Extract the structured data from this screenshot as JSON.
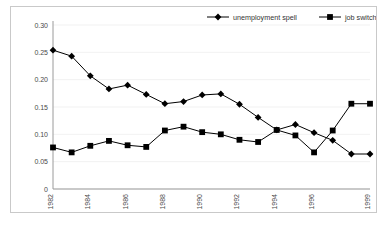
{
  "chart_data": {
    "type": "line",
    "title": "",
    "xlabel": "",
    "ylabel": "",
    "ylim": [
      0,
      0.3
    ],
    "grid": true,
    "legend_position": "top-right",
    "x": [
      1982,
      1983,
      1984,
      1985,
      1986,
      1987,
      1988,
      1989,
      1990,
      1991,
      1992,
      1993,
      1994,
      1995,
      1996,
      1997,
      1998,
      1999
    ],
    "x_tick_labels": [
      "1982",
      "",
      "1984",
      "",
      "1986",
      "",
      "1988",
      "",
      "1990",
      "",
      "1992",
      "",
      "1994",
      "",
      "1996",
      "",
      "",
      "1999"
    ],
    "y_tick_labels": [
      "0.30",
      "0.25",
      "0.20",
      "0.15",
      "0.10",
      "0.05",
      "0"
    ],
    "y_tick_values": [
      0.3,
      0.25,
      0.2,
      0.15,
      0.1,
      0.05,
      0
    ],
    "series": [
      {
        "name": "unemployment spell",
        "marker": "diamond",
        "color": "#000000",
        "values": [
          0.254,
          0.243,
          0.207,
          0.183,
          0.19,
          0.173,
          0.156,
          0.16,
          0.172,
          0.174,
          0.155,
          0.131,
          0.108,
          0.118,
          0.103,
          0.089,
          0.064,
          0.064
        ]
      },
      {
        "name": "job switch",
        "marker": "square",
        "color": "#000000",
        "values": [
          0.076,
          0.067,
          0.079,
          0.088,
          0.08,
          0.077,
          0.107,
          0.114,
          0.104,
          0.1,
          0.09,
          0.086,
          0.108,
          0.098,
          0.067,
          0.107,
          0.156,
          0.156
        ]
      }
    ]
  },
  "legend": {
    "items": [
      {
        "label": "unemployment spell",
        "marker": "diamond"
      },
      {
        "label": "job switch",
        "marker": "square"
      }
    ]
  }
}
